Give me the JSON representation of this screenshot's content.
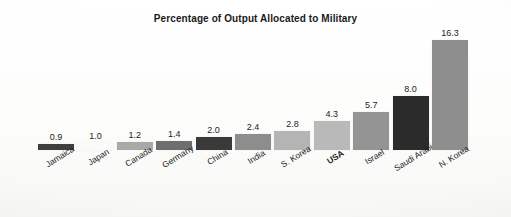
{
  "chart_data": {
    "type": "bar",
    "title": "Percentage of Output Allocated to Military",
    "xlabel": "",
    "ylabel": "",
    "ylim": [
      0,
      16.3
    ],
    "grid": false,
    "legend": null,
    "categories": [
      "Jamaica",
      "Japan",
      "Canada",
      "Germany",
      "China",
      "India",
      "S. Korea",
      "USA",
      "Israel",
      "Saudi Arabia",
      "N. Korea"
    ],
    "values": [
      0.9,
      1.0,
      1.2,
      1.4,
      2.0,
      2.4,
      2.8,
      4.3,
      5.7,
      8.0,
      16.3
    ],
    "value_labels": [
      "0.9",
      "1.0",
      "1.2",
      "1.4",
      "2.0",
      "2.4",
      "2.8",
      "4.3",
      "5.7",
      "8.0",
      "16.3"
    ],
    "bar_colors": [
      "#3f3f3f",
      "#fbfbfb",
      "#a9a9a9",
      "#6e6e6e",
      "#3a3a3a",
      "#8d8d8d",
      "#b4b4b4",
      "#b9b9b9",
      "#949494",
      "#2b2b2b",
      "#8e8e8e"
    ],
    "emphasized_category": "USA"
  },
  "title": "Percentage of Output Allocated to Military"
}
